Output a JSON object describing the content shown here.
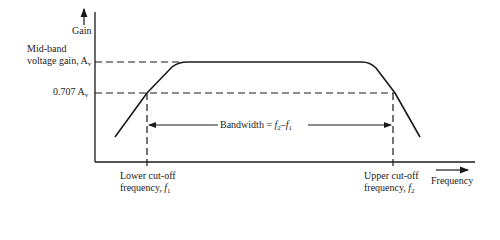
{
  "diagram": {
    "y_axis_label": "Gain",
    "x_axis_label": "Frequency",
    "midband_label_line1": "Mid-band",
    "midband_label_line2": "voltage gain, A",
    "midband_label_sub": "v",
    "cutoff_level_label": "0.707 A",
    "cutoff_level_sub": "v",
    "bandwidth_label_prefix": "Bandwidth = ",
    "bandwidth_f2": "f",
    "bandwidth_f2_sub": "2",
    "bandwidth_minus": "–",
    "bandwidth_f1": "f",
    "bandwidth_f1_sub": "1",
    "lower_cutoff_line1": "Lower cut-off",
    "lower_cutoff_line2": "frequency, ",
    "lower_cutoff_symbol": "f",
    "lower_cutoff_sub": "1",
    "upper_cutoff_line1": "Upper cut-off",
    "upper_cutoff_line2": "frequency, ",
    "upper_cutoff_symbol": "f",
    "upper_cutoff_sub": "2",
    "colors": {
      "ink": "#1a1a1a",
      "background": "#ffffff"
    }
  }
}
